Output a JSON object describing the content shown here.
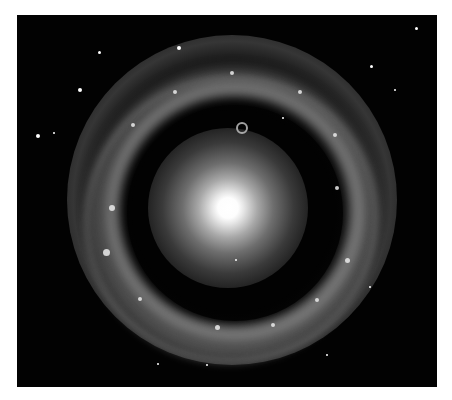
{
  "image": {
    "subject": "ring galaxy",
    "description": "Bright yellowish-white central core surrounded by a dark gap and a clumpy bright ring of stars against a black starfield",
    "colors": {
      "background_border": "#ffffff",
      "space": "#020202",
      "core": "#ffffff",
      "ring": "#a0a0a0"
    },
    "stars": [
      {
        "x": 82,
        "y": 37,
        "r": 1.5
      },
      {
        "x": 63,
        "y": 75,
        "r": 2
      },
      {
        "x": 37,
        "y": 118,
        "r": 1
      },
      {
        "x": 21,
        "y": 121,
        "r": 2
      },
      {
        "x": 162,
        "y": 33,
        "r": 2
      },
      {
        "x": 354,
        "y": 51,
        "r": 1.5
      },
      {
        "x": 399,
        "y": 13,
        "r": 1.5
      },
      {
        "x": 378,
        "y": 75,
        "r": 1
      },
      {
        "x": 219,
        "y": 245,
        "r": 1
      },
      {
        "x": 266,
        "y": 103,
        "r": 1
      },
      {
        "x": 353,
        "y": 272,
        "r": 1
      },
      {
        "x": 310,
        "y": 340,
        "r": 1
      },
      {
        "x": 141,
        "y": 349,
        "r": 1
      },
      {
        "x": 190,
        "y": 350,
        "r": 1
      }
    ],
    "knots": [
      {
        "x": 95,
        "y": 193,
        "r": 3
      },
      {
        "x": 89,
        "y": 237,
        "r": 3.5
      },
      {
        "x": 320,
        "y": 173,
        "r": 2
      },
      {
        "x": 330,
        "y": 245,
        "r": 2.5
      },
      {
        "x": 283,
        "y": 77,
        "r": 2
      },
      {
        "x": 158,
        "y": 77,
        "r": 2
      },
      {
        "x": 200,
        "y": 312,
        "r": 2.5
      },
      {
        "x": 256,
        "y": 310,
        "r": 2
      },
      {
        "x": 123,
        "y": 284,
        "r": 2
      },
      {
        "x": 318,
        "y": 120,
        "r": 2
      },
      {
        "x": 300,
        "y": 285,
        "r": 2
      },
      {
        "x": 116,
        "y": 110,
        "r": 2
      },
      {
        "x": 215,
        "y": 58,
        "r": 2
      }
    ],
    "mini_ring": {
      "x": 225,
      "y": 113
    }
  }
}
